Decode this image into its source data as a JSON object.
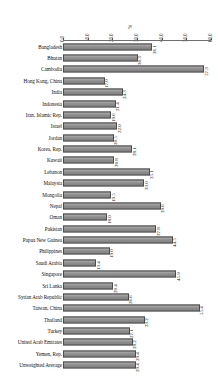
{
  "chart_data": {
    "type": "bar",
    "orientation": "horizontal",
    "title": "",
    "xlabel": "%",
    "ylabel": "",
    "xlim": [
      0.0,
      60.0
    ],
    "xticks": [
      "0.0",
      "10.0",
      "20.0",
      "30.0",
      "40.0",
      "50.0",
      "60.0"
    ],
    "grid": false,
    "legend": "none",
    "bar_color": "#8e8e8e",
    "bar_edge_color": "#4d4d4d",
    "categories": [
      "Bangladesh",
      "Bhutan",
      "Cambodia",
      "Hong Kong, China",
      "India",
      "Indonesia",
      "Iran, Islamic Rep.",
      "Israel",
      "Jordan",
      "Korea, Rep.",
      "Kuwait",
      "Lebanon",
      "Malaysia",
      "Mongolia",
      "Nepal",
      "Oman",
      "Pakistan",
      "Papua New Guinea",
      "Philippines",
      "Saudi Arabia",
      "Singapore",
      "Sri Lanka",
      "Syrian Arab Republic",
      "Taiwan, China",
      "Thailand",
      "Turkey",
      "United Arab Emirates",
      "Yemen, Rep.",
      "Unweighted Average"
    ],
    "values": [
      36.1,
      30.3,
      57.3,
      17.0,
      24.3,
      21.4,
      19.6,
      22.0,
      20.5,
      28.1,
      20.8,
      35.1,
      33.0,
      19.5,
      39.6,
      18.0,
      37.8,
      44.5,
      19.0,
      13.4,
      45.9,
      20.4,
      26.6,
      55.4,
      33.2,
      27.1,
      28.2,
      29.4,
      29.4
    ],
    "value_labels": [
      "36.1",
      "30.3",
      "57.3",
      "17.0",
      "24.3",
      "21.4",
      "19.6",
      "22.0",
      "20.5",
      "28.1",
      "20.8",
      "35.1",
      "33.0",
      "19.5",
      "39.6",
      "18.0",
      "37.8",
      "44.5",
      "19.0",
      "13.4",
      "45.9",
      "20.4",
      "26.6",
      "55.4",
      "33.2",
      "27.1",
      "28.2",
      "29.4",
      "29.4"
    ]
  }
}
